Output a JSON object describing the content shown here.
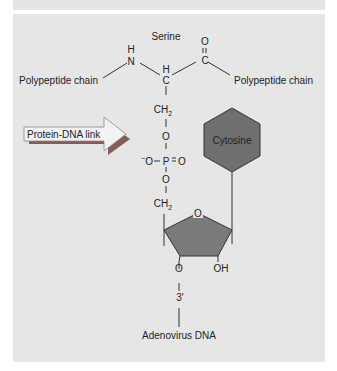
{
  "diagram": {
    "title": "Serine",
    "labels": {
      "polypeptide_left": "Polypeptide chain",
      "polypeptide_right": "Polypeptide chain",
      "link_arrow": "Protein-DNA link",
      "base": "Cytosine",
      "dna": "Adenovirus DNA"
    },
    "atoms": {
      "n_h": "H",
      "n": "N",
      "ca_h": "H",
      "ca": "C",
      "c_o": "O",
      "c": "C",
      "ch2_top": "CH",
      "ch2_top_sub": "2",
      "o_link": "O",
      "o_minus": "O",
      "minus": "−",
      "p": "P",
      "p_eq_o": "O",
      "o_lower": "O",
      "ch2_bottom": "CH",
      "ch2_bottom_sub": "2",
      "ring_o": "O",
      "o3": "O",
      "oh": "OH",
      "three_prime": "3'"
    },
    "colors": {
      "background": "#e6e6e6",
      "hexagon_fill": "#6f6f6f",
      "pentagon_fill": "#7a7a7a",
      "arrow_fill": "#f2f2f2",
      "arrow_shadow": "#8a5a5a",
      "line": "#333333"
    }
  }
}
